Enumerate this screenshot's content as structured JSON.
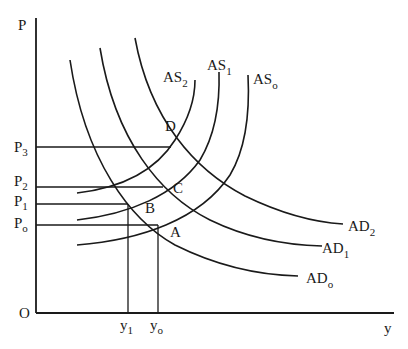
{
  "diagram": {
    "title": "",
    "axes": {
      "y_label": "P",
      "x_label": "y",
      "origin_label": "O"
    },
    "price_levels": [
      {
        "base": "P",
        "sub": "3"
      },
      {
        "base": "P",
        "sub": "2"
      },
      {
        "base": "P",
        "sub": "1"
      },
      {
        "base": "P",
        "sub": "o"
      }
    ],
    "output_levels": [
      {
        "base": "y",
        "sub": "1"
      },
      {
        "base": "y",
        "sub": "o"
      }
    ],
    "supply_curves": [
      {
        "base": "AS",
        "sub": "2"
      },
      {
        "base": "AS",
        "sub": "1"
      },
      {
        "base": "AS",
        "sub": "o"
      }
    ],
    "demand_curves": [
      {
        "base": "AD",
        "sub": "2"
      },
      {
        "base": "AD",
        "sub": "1"
      },
      {
        "base": "AD",
        "sub": "o"
      }
    ],
    "points": [
      "A",
      "B",
      "C",
      "D"
    ],
    "colors": {
      "ink": "#1a1a1a",
      "background": "#ffffff"
    }
  }
}
